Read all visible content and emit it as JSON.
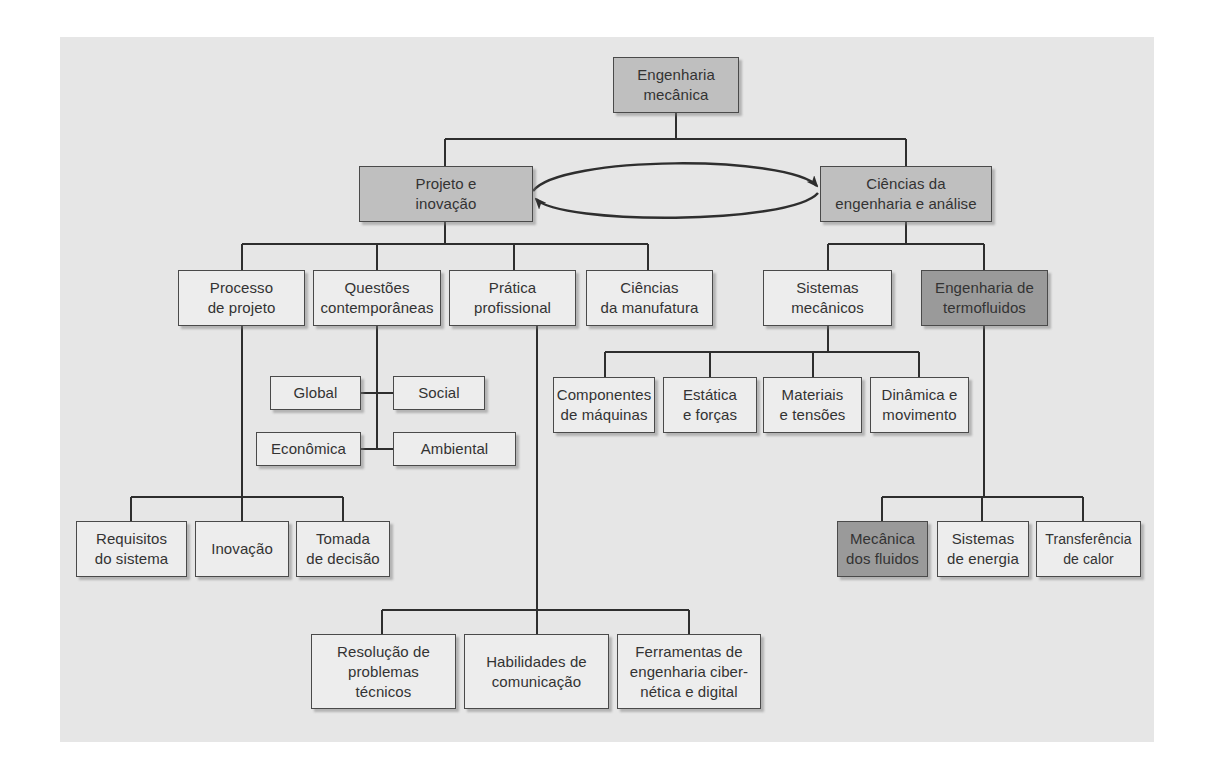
{
  "diagram": {
    "title": "Engenharia mecânica",
    "colors": {
      "panel": "#e6e6e6",
      "light_box": "#ededed",
      "mid_box": "#bfbfbf",
      "dark_box": "#9a9a9a",
      "line": "#2e2e2e"
    },
    "root": {
      "label": "Engenharia\nmecânica"
    },
    "level1": [
      {
        "id": "projeto",
        "label": "Projeto e\ninovação"
      },
      {
        "id": "ciencias",
        "label": "Ciências da\nengenharia e análise"
      }
    ],
    "cycle_arrow": "bidirectional loop between Projeto e inovação and Ciências da engenharia e análise",
    "projeto_children": [
      {
        "label": "Processo\nde projeto"
      },
      {
        "label": "Questões\ncontemporâneas"
      },
      {
        "label": "Prática\nprofissional"
      },
      {
        "label": "Ciências\nda manufatura"
      }
    ],
    "ciencias_children": [
      {
        "label": "Sistemas\nmecânicos"
      },
      {
        "label": "Engenharia de\ntermofluidos"
      }
    ],
    "questoes_children": [
      {
        "label": "Global"
      },
      {
        "label": "Social"
      },
      {
        "label": "Econômica"
      },
      {
        "label": "Ambiental"
      }
    ],
    "processo_children": [
      {
        "label": "Requisitos\ndo sistema"
      },
      {
        "label": "Inovação"
      },
      {
        "label": "Tomada\nde decisão"
      }
    ],
    "pratica_children": [
      {
        "label": "Resolução de\nproblemas\ntécnicos"
      },
      {
        "label": "Habilidades de\ncomunicação"
      },
      {
        "label": "Ferramentas de\nengenharia ciber-\nnética e digital"
      }
    ],
    "sistemas_children": [
      {
        "label": "Componentes\nde máquinas"
      },
      {
        "label": "Estática\ne forças"
      },
      {
        "label": "Materiais\ne tensões"
      },
      {
        "label": "Dinâmica e\nmovimento"
      }
    ],
    "termofluidos_children": [
      {
        "label": "Mecânica\ndos fluidos"
      },
      {
        "label": "Sistemas\nde energia"
      },
      {
        "label": "Transferência\nde calor"
      }
    ]
  }
}
